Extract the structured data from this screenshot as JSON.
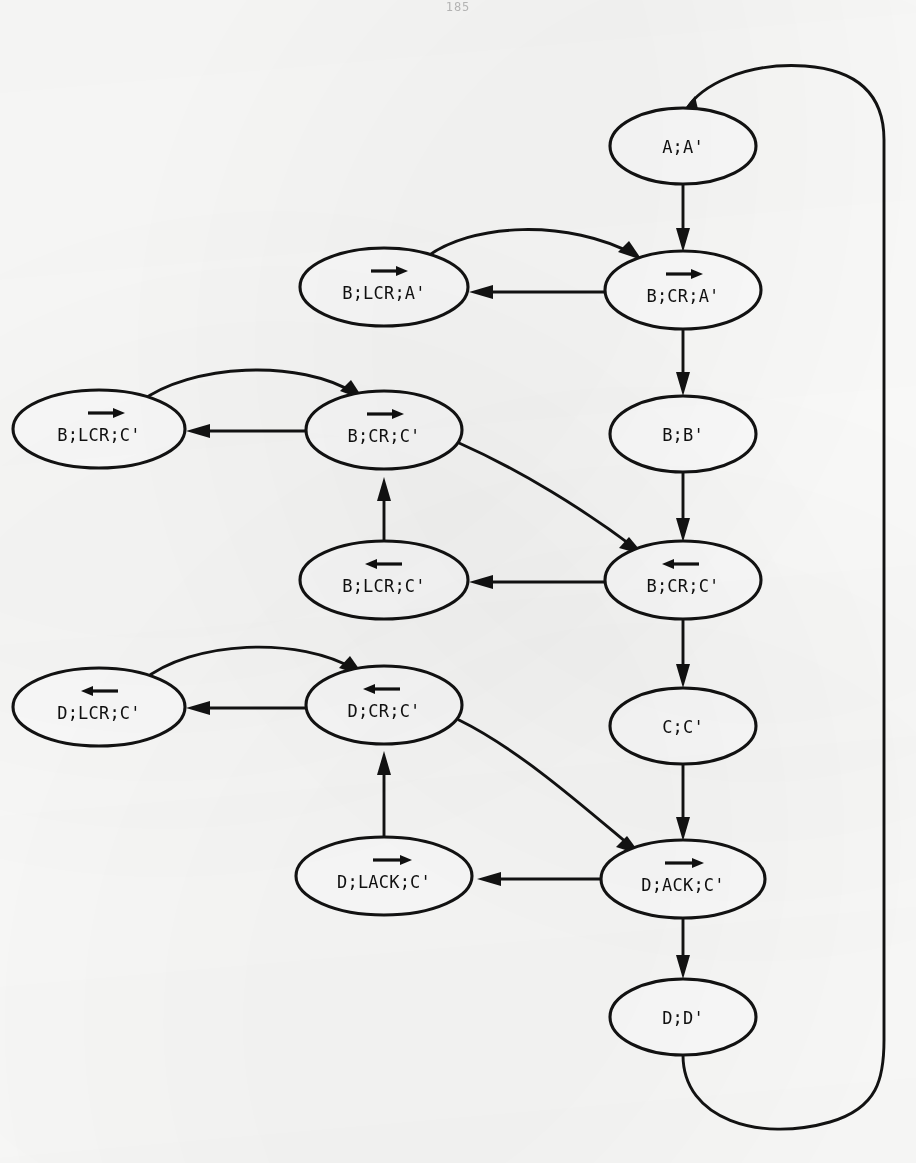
{
  "page": {
    "number": "185",
    "width": 916,
    "height": 1163,
    "background_color": "#fdfdfc",
    "ink_color": "#121212"
  },
  "diagram": {
    "type": "state-transition-diagram",
    "title": "",
    "node_shape": "ellipse",
    "nodes": [
      {
        "id": "n1",
        "label": "A;A'",
        "prefix": "A;A'",
        "marked_token": "",
        "marked_direction": "none",
        "suffix": "",
        "cx": 683,
        "cy": 146,
        "rx": 73,
        "ry": 38
      },
      {
        "id": "n2",
        "label": "B;CR;A'",
        "prefix": "B;",
        "marked_token": "CR",
        "marked_direction": "right",
        "suffix": ";A'",
        "cx": 683,
        "cy": 290,
        "rx": 78,
        "ry": 39
      },
      {
        "id": "n3",
        "label": "B;LCR;A'",
        "prefix": "B;L",
        "marked_token": "CR",
        "marked_direction": "right",
        "suffix": ";A'",
        "cx": 384,
        "cy": 287,
        "rx": 84,
        "ry": 39
      },
      {
        "id": "n4",
        "label": "B;B'",
        "prefix": "B;B'",
        "marked_token": "",
        "marked_direction": "none",
        "suffix": "",
        "cx": 683,
        "cy": 434,
        "rx": 73,
        "ry": 38
      },
      {
        "id": "n5",
        "label": "B;CR;C'",
        "prefix": "B;",
        "marked_token": "CR",
        "marked_direction": "right",
        "suffix": ";C'",
        "cx": 384,
        "cy": 430,
        "rx": 78,
        "ry": 39
      },
      {
        "id": "n6",
        "label": "B;LCR;C'",
        "prefix": "B;L",
        "marked_token": "CR",
        "marked_direction": "right",
        "suffix": ";C'",
        "cx": 99,
        "cy": 429,
        "rx": 86,
        "ry": 39
      },
      {
        "id": "n7",
        "label": "B;CR;C'",
        "prefix": "B;",
        "marked_token": "CR",
        "marked_direction": "left",
        "suffix": ";C'",
        "cx": 683,
        "cy": 580,
        "rx": 78,
        "ry": 39
      },
      {
        "id": "n8",
        "label": "B;LCR;C'",
        "prefix": "B;L",
        "marked_token": "CR",
        "marked_direction": "left",
        "suffix": ";C'",
        "cx": 384,
        "cy": 580,
        "rx": 84,
        "ry": 39
      },
      {
        "id": "n9",
        "label": "C;C'",
        "prefix": "C;C'",
        "marked_token": "",
        "marked_direction": "none",
        "suffix": "",
        "cx": 683,
        "cy": 726,
        "rx": 73,
        "ry": 38
      },
      {
        "id": "n10",
        "label": "D;CR;C'",
        "prefix": "D;",
        "marked_token": "CR",
        "marked_direction": "left",
        "suffix": ";C'",
        "cx": 384,
        "cy": 705,
        "rx": 78,
        "ry": 39
      },
      {
        "id": "n11",
        "label": "D;LCR;C'",
        "prefix": "D;L",
        "marked_token": "CR",
        "marked_direction": "left",
        "suffix": ";C'",
        "cx": 99,
        "cy": 707,
        "rx": 86,
        "ry": 39
      },
      {
        "id": "n12",
        "label": "D;ACK;C'",
        "prefix": "D;",
        "marked_token": "ACK",
        "marked_direction": "right",
        "suffix": ";C'",
        "cx": 683,
        "cy": 879,
        "rx": 82,
        "ry": 39
      },
      {
        "id": "n13",
        "label": "D;LACK;C'",
        "prefix": "D;L",
        "marked_token": "ACK",
        "marked_direction": "right",
        "suffix": ";C'",
        "cx": 384,
        "cy": 876,
        "rx": 88,
        "ry": 39
      },
      {
        "id": "n14",
        "label": "D;D'",
        "prefix": "D;D'",
        "marked_token": "",
        "marked_direction": "none",
        "suffix": "",
        "cx": 683,
        "cy": 1017,
        "rx": 73,
        "ry": 38
      }
    ],
    "edges": [
      {
        "id": "e1",
        "from": "n1",
        "to": "n2",
        "shape": "straight-down",
        "description": "A;A' to B;CR;A'"
      },
      {
        "id": "e2",
        "from": "n2",
        "to": "n3",
        "shape": "straight-left",
        "description": "B;CR;A' to B;LCR;A'"
      },
      {
        "id": "e3",
        "from": "n3",
        "to": "n2",
        "shape": "arc-over-right",
        "description": "B;LCR;A' back to B;CR;A'"
      },
      {
        "id": "e4",
        "from": "n2",
        "to": "n4",
        "shape": "straight-down",
        "description": "B;CR;A' to B;B'"
      },
      {
        "id": "e5",
        "from": "n4",
        "to": "n7",
        "shape": "straight-down",
        "description": "B;B' to B;CR;C' (left)"
      },
      {
        "id": "e6",
        "from": "n5",
        "to": "n6",
        "shape": "straight-left",
        "description": "B;CR;C' to B;LCR;C'"
      },
      {
        "id": "e7",
        "from": "n6",
        "to": "n5",
        "shape": "arc-over-right",
        "description": "B;LCR;C' back to B;CR;C'"
      },
      {
        "id": "e8",
        "from": "n5",
        "to": "n7",
        "shape": "curve-down-right",
        "description": "B;CR;C' (right) to B;CR;C' (left)"
      },
      {
        "id": "e9",
        "from": "n7",
        "to": "n8",
        "shape": "straight-left",
        "description": "B;CR;C' (left) to B;LCR;C' (left)"
      },
      {
        "id": "e10",
        "from": "n8",
        "to": "n5",
        "shape": "straight-up",
        "description": "B;LCR;C' (left) up to B;CR;C' (right)"
      },
      {
        "id": "e11",
        "from": "n7",
        "to": "n9",
        "shape": "straight-down",
        "description": "B;CR;C' (left) to C;C'"
      },
      {
        "id": "e12",
        "from": "n9",
        "to": "n12",
        "shape": "straight-down",
        "description": "C;C' to D;ACK;C'"
      },
      {
        "id": "e13",
        "from": "n10",
        "to": "n11",
        "shape": "straight-left",
        "description": "D;CR;C' to D;LCR;C'"
      },
      {
        "id": "e14",
        "from": "n11",
        "to": "n10",
        "shape": "arc-over-right",
        "description": "D;LCR;C' back to D;CR;C'"
      },
      {
        "id": "e15",
        "from": "n10",
        "to": "n12",
        "shape": "curve-down-right",
        "description": "D;CR;C' to D;ACK;C'"
      },
      {
        "id": "e16",
        "from": "n12",
        "to": "n13",
        "shape": "straight-left",
        "description": "D;ACK;C' to D;LACK;C'"
      },
      {
        "id": "e17",
        "from": "n13",
        "to": "n10",
        "shape": "straight-up",
        "description": "D;LACK;C' up to D;CR;C'"
      },
      {
        "id": "e18",
        "from": "n12",
        "to": "n14",
        "shape": "straight-down",
        "description": "D;ACK;C' to D;D'"
      },
      {
        "id": "e19",
        "from": "n14",
        "to": "n1",
        "shape": "outer-loop-right",
        "description": "D;D' wraps around right edge back to A;A'"
      }
    ]
  }
}
